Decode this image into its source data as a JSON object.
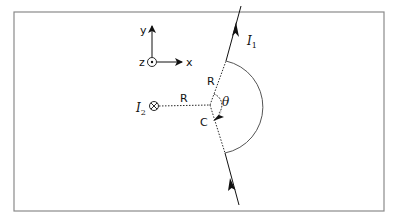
{
  "figure": {
    "frame": {
      "x": 14,
      "y": 12,
      "width": 370,
      "height": 199,
      "stroke": "#8a8a8a"
    },
    "axes": {
      "x_label": "x",
      "y_label": "y",
      "z_label": "z",
      "z_symbol": "out-of-page (dot in circle)"
    },
    "wire1": {
      "label": "I",
      "subscript": "1",
      "direction": "upward along line, arrows point toward top-right"
    },
    "wire2": {
      "label": "I",
      "subscript": "2",
      "symbol": "into-page (cross in circle)"
    },
    "distance_labels": {
      "upper_R": "R",
      "horizontal_R": "R"
    },
    "center_label": "C",
    "angle_label": "θ",
    "colors": {
      "line": "#1a1a1a",
      "arc": "#555555",
      "frame": "#8a8a8a"
    }
  }
}
